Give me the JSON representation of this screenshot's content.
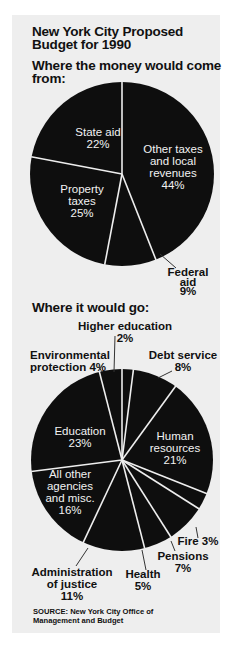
{
  "title": {
    "line1": "New York City Proposed",
    "line2": "Budget for 1990"
  },
  "income": {
    "heading_line1": "Where the money would come",
    "heading_line2": "from:"
  },
  "spending": {
    "heading": "Where it would go:"
  },
  "labels": {
    "other_taxes": [
      "Other taxes",
      "and local",
      "revenues",
      "44%"
    ],
    "federal_aid": [
      "Federal",
      "aid",
      "9%"
    ],
    "property_taxes": [
      "Property",
      "taxes",
      "25%"
    ],
    "state_aid": [
      "State aid",
      "22%"
    ],
    "higher_education": [
      "Higher education",
      "2%"
    ],
    "debt_service": [
      "Debt service",
      "8%"
    ],
    "human_resources": [
      "Human",
      "resources",
      "21%"
    ],
    "fire": [
      "Fire 3%"
    ],
    "pensions": [
      "Pensions",
      "7%"
    ],
    "health": [
      "Health",
      "5%"
    ],
    "administration_of_justice": [
      "Administration",
      "of justice",
      "11%"
    ],
    "all_other": [
      "All other",
      "agencies",
      "and misc.",
      "16%"
    ],
    "education": [
      "Education",
      "23%"
    ],
    "environmental_protection": [
      "Environmental",
      "protection 4%"
    ]
  },
  "source": {
    "line1": "SOURCE: New York City Office of",
    "line2": "Management and Budget"
  },
  "colors": {
    "slice": "#0e0e0e",
    "divider": "#eeeeee",
    "panel": "#eeeeee",
    "text": "#111111"
  },
  "chart_data": [
    {
      "type": "pie",
      "title": "Where the money would come from:",
      "subtitle": "New York City Proposed Budget for 1990",
      "start_angle_deg": 0,
      "direction": "clockwise",
      "categories": [
        "Other taxes and local revenues",
        "Federal aid",
        "Property taxes",
        "State aid"
      ],
      "values": [
        44,
        9,
        25,
        22
      ],
      "unit": "%"
    },
    {
      "type": "pie",
      "title": "Where it would go:",
      "subtitle": "New York City Proposed Budget for 1990",
      "start_angle_deg": 0,
      "direction": "clockwise",
      "categories": [
        "Higher education",
        "Debt service",
        "Human resources",
        "Fire",
        "Pensions",
        "Health",
        "Administration of justice",
        "All other agencies and misc.",
        "Education",
        "Environmental protection"
      ],
      "values": [
        2,
        8,
        21,
        3,
        7,
        5,
        11,
        16,
        23,
        4
      ],
      "unit": "%",
      "source": "SOURCE: New York City Office of Management and Budget"
    }
  ]
}
